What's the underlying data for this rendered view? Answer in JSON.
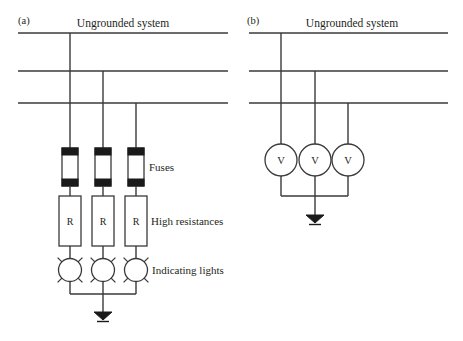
{
  "figure": {
    "background_color": "#ffffff",
    "line_color": "#3a3a3a",
    "text_color": "#231f20",
    "fill_color": "#ffffff",
    "cap_color": "#1a1a1a"
  },
  "panels": [
    {
      "id": "a",
      "label": "(a)",
      "title": "Ungrounded system",
      "bus_count": 3,
      "components": {
        "fuse_label": "Fuses",
        "resistor_label": "High resistances",
        "resistor_symbol": "R",
        "lamp_label": "Indicating lights",
        "ground_symbol": "earth-ground",
        "branch_count": 3
      },
      "annotations": [
        {
          "name": "fuses",
          "text": "Fuses"
        },
        {
          "name": "high-resistances",
          "text": "High resistances"
        },
        {
          "name": "indicating-lights",
          "text": "Indicating lights"
        }
      ],
      "resistors": [
        "R",
        "R",
        "R"
      ]
    },
    {
      "id": "b",
      "label": "(b)",
      "title": "Ungrounded system",
      "bus_count": 3,
      "components": {
        "meter_symbol": "V",
        "meter_count": 3,
        "ground_symbol": "earth-ground",
        "branch_count": 3
      },
      "meters": [
        "V",
        "V",
        "V"
      ]
    }
  ]
}
